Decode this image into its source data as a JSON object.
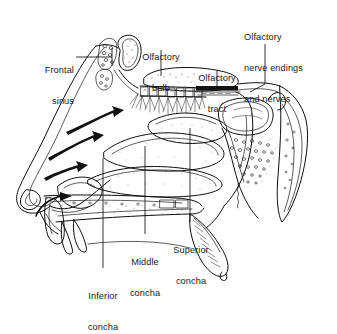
{
  "figure": {
    "background_color": "#ffffff",
    "ink_color": "#111111",
    "width": 337,
    "height": 323
  },
  "labels": [
    {
      "id": "frontal-sinus",
      "text": "Frontal\nsinus",
      "line1": "Frontal",
      "line2": "sinus",
      "align": "right",
      "x": 36,
      "y": 44,
      "leader": "horizontal"
    },
    {
      "id": "olfactory-bulb",
      "text": "Olfactory\nbulb",
      "line1": "Olfactory",
      "line2": "bulb",
      "align": "center",
      "x": 155,
      "y": 31,
      "leader": "vertical"
    },
    {
      "id": "olfactory-tract",
      "text": "Olfactory\ntract",
      "line1": "Olfactory",
      "line2": "tract",
      "align": "center",
      "x": 204,
      "y": 52,
      "leader": "vertical"
    },
    {
      "id": "olfactory-nerve-endings-and-nerves",
      "text": "Olfactory\nnerve endings\nand nerves",
      "line1": "Olfactory",
      "line2": "nerve endings",
      "line3": "and nerves",
      "align": "left",
      "x": 244,
      "y": 11,
      "leader": "vertical-bent"
    },
    {
      "id": "middle-concha",
      "text": "Middle\nconcha",
      "line1": "Middle",
      "line2": "concha",
      "align": "center",
      "x": 127,
      "y": 238,
      "leader": "vertical"
    },
    {
      "id": "superior-concha",
      "text": "Superior\nconcha",
      "line1": "Superior",
      "line2": "concha",
      "align": "center",
      "x": 172,
      "y": 226,
      "leader": "vertical"
    },
    {
      "id": "inferior-concha",
      "text": "Inferior\nconcha",
      "line1": "Inferior",
      "line2": "concha",
      "align": "center",
      "x": 78,
      "y": 273,
      "leader": "vertical"
    }
  ],
  "structures": [
    {
      "id": "nose-external-profile",
      "name": "external nose profile"
    },
    {
      "id": "frontal-sinus-cavity",
      "name": "frontal sinus cavity"
    },
    {
      "id": "ethmoid-air-cells",
      "name": "ethmoid air cells"
    },
    {
      "id": "cribriform-plate",
      "name": "cribriform plate"
    },
    {
      "id": "olfactory-bulb-body",
      "name": "olfactory bulb"
    },
    {
      "id": "olfactory-tract-band",
      "name": "olfactory tract"
    },
    {
      "id": "olfactory-nerve-fibers",
      "name": "olfactory nerve fibers"
    },
    {
      "id": "superior-concha-shelf",
      "name": "superior concha"
    },
    {
      "id": "middle-concha-shelf",
      "name": "middle concha"
    },
    {
      "id": "inferior-concha-shelf",
      "name": "inferior concha"
    },
    {
      "id": "sphenoid-sinus-cavity",
      "name": "sphenoid sinus"
    },
    {
      "id": "cancellous-bone",
      "name": "cancellous bone stippling"
    },
    {
      "id": "hard-palate",
      "name": "hard palate"
    },
    {
      "id": "soft-palate",
      "name": "soft palate"
    },
    {
      "id": "pterygoid-process",
      "name": "pterygoid process"
    },
    {
      "id": "nasopharynx",
      "name": "nasopharynx"
    }
  ],
  "airflow_arrows": [
    {
      "id": "airflow-arrow-upper",
      "direction": "up-right"
    },
    {
      "id": "airflow-arrow-middle",
      "direction": "up-right"
    },
    {
      "id": "airflow-arrow-lower",
      "direction": "up-right"
    },
    {
      "id": "airflow-arrow-nostril",
      "direction": "curved-up"
    }
  ]
}
